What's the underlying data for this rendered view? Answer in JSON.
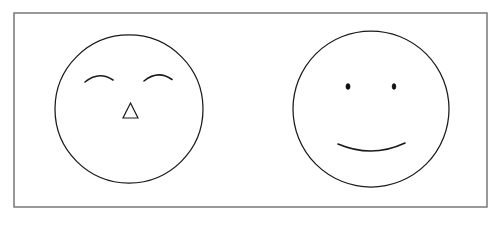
{
  "canvas": {
    "width": 500,
    "height": 228,
    "background_color": "#ffffff",
    "title": "Two drawn faces"
  },
  "frame": {
    "name": "border-frame",
    "x": 14,
    "y": 13,
    "width": 473,
    "height": 194,
    "stroke_color": "#6e6e73",
    "stroke_width": 1.4
  },
  "ink_color": "#1a1a1a",
  "figures": [
    {
      "id": "left-face",
      "label": "Face with closed eyes and triangle nose",
      "expression": "serene",
      "circle": {
        "cx": 129,
        "cy": 109,
        "r": 74
      },
      "features": [
        {
          "id": "left-face-left-eye",
          "type": "closed-eye-arc",
          "path": "M 85 82 Q 99 71 113 80"
        },
        {
          "id": "left-face-right-eye",
          "type": "closed-eye-arc",
          "path": "M 144 81 Q 158 70 172 80"
        },
        {
          "id": "left-face-nose",
          "type": "triangle-nose",
          "path": "M 130.5 103 L 138 118 L 123 118 Z"
        }
      ]
    },
    {
      "id": "right-face",
      "label": "Smiling face with dot eyes",
      "expression": "smiling",
      "circle": {
        "cx": 371,
        "cy": 109,
        "r": 78
      },
      "features": [
        {
          "id": "right-face-left-eye",
          "type": "dot-eye",
          "cx": 348,
          "cy": 86.5,
          "rx": 2.1,
          "ry": 2.9
        },
        {
          "id": "right-face-right-eye",
          "type": "dot-eye",
          "cx": 394,
          "cy": 86.5,
          "rx": 1.9,
          "ry": 2.9
        },
        {
          "id": "right-face-mouth",
          "type": "smile-arc",
          "path": "M 338 144 Q 372 158 405 143"
        }
      ]
    }
  ]
}
